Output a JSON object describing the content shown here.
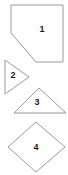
{
  "figure": {
    "background_color": "#ffffff",
    "stroke_color": "#9a9a9a",
    "label_color": "#1a1a1a",
    "width": 68,
    "height": 175,
    "shapes": [
      {
        "label": "1",
        "name": "pentagon-cut-corner",
        "points": "11,5 63,5 63,62 36,62 11,33",
        "label_x": 42,
        "label_y": 30
      },
      {
        "label": "2",
        "name": "triangle-right",
        "points": "5,60 5,94 29,77",
        "label_x": 13,
        "label_y": 76
      },
      {
        "label": "3",
        "name": "triangle-up",
        "points": "39,88 66,113 14,113",
        "label_x": 37,
        "label_y": 103
      },
      {
        "label": "4",
        "name": "diamond",
        "points": "36,122 65,147 36,172 8,147",
        "label_x": 36,
        "label_y": 148
      }
    ]
  }
}
